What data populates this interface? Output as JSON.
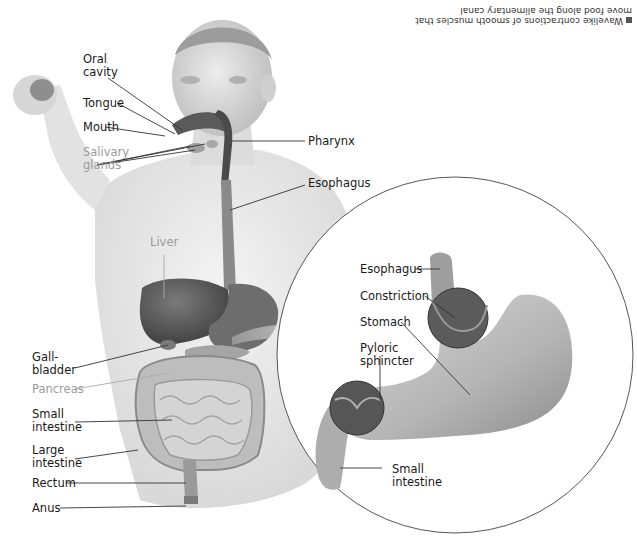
{
  "caption": {
    "text": "Wavelike contractions of smooth muscles that move food along the alimentary canal",
    "orientation": "upside-down"
  },
  "left_labels": [
    {
      "id": "oral-cavity",
      "lines": [
        "Oral",
        "cavity"
      ],
      "color": "dark"
    },
    {
      "id": "tongue",
      "lines": [
        "Tongue"
      ],
      "color": "dark"
    },
    {
      "id": "mouth",
      "lines": [
        "Mouth"
      ],
      "color": "dark"
    },
    {
      "id": "salivary-glands",
      "lines": [
        "Salivary",
        "glands"
      ],
      "color": "gray"
    },
    {
      "id": "liver",
      "lines": [
        "Liver"
      ],
      "color": "gray"
    },
    {
      "id": "gallbladder",
      "lines": [
        "Gall-",
        "bladder"
      ],
      "color": "dark"
    },
    {
      "id": "pancreas",
      "lines": [
        "Pancreas"
      ],
      "color": "gray"
    },
    {
      "id": "small-intestine",
      "lines": [
        "Small",
        "intestine"
      ],
      "color": "dark"
    },
    {
      "id": "large-intestine",
      "lines": [
        "Large",
        "intestine"
      ],
      "color": "dark"
    },
    {
      "id": "rectum",
      "lines": [
        "Rectum"
      ],
      "color": "dark"
    },
    {
      "id": "anus",
      "lines": [
        "Anus"
      ],
      "color": "dark"
    }
  ],
  "right_labels": [
    {
      "id": "pharynx",
      "lines": [
        "Pharynx"
      ]
    },
    {
      "id": "esophagus",
      "lines": [
        "Esophagus"
      ]
    }
  ],
  "inset": {
    "labels": [
      {
        "id": "inset-esophagus",
        "lines": [
          "Esophagus"
        ]
      },
      {
        "id": "constriction",
        "lines": [
          "Constriction"
        ]
      },
      {
        "id": "stomach",
        "lines": [
          "Stomach"
        ]
      },
      {
        "id": "pyloric-sphincter",
        "lines": [
          "Pyloric",
          "sphincter"
        ]
      },
      {
        "id": "inset-small-intestine",
        "lines": [
          "Small",
          "intestine"
        ]
      }
    ]
  },
  "colors": {
    "label_dark": "#1a1a1a",
    "label_gray": "#9a9a9a",
    "leader_line": "#333333",
    "skin": "#e9e9e9",
    "organ_dark": "#555555",
    "organ_mid": "#8a8a8a",
    "intestine": "#c8c8c8",
    "circle_stroke": "#555555"
  }
}
